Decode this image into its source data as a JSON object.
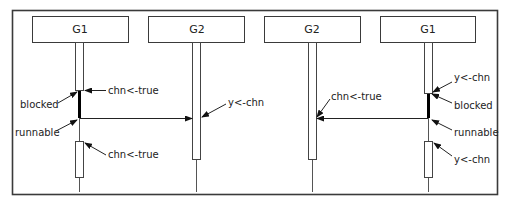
{
  "diagram": {
    "type": "sequence-diagram",
    "colors": {
      "stroke": "#3a3a3a",
      "blocked": "#000000",
      "text": "#222222",
      "background": "#ffffff"
    },
    "left_panel": {
      "participants": [
        {
          "id": "g1_left",
          "label": "G1"
        },
        {
          "id": "g2_left",
          "label": "G2"
        }
      ],
      "annotations": {
        "g1_first": "chn<-true",
        "g1_blocked": "blocked",
        "g1_runnable": "runnable",
        "g1_second": "chn<-true",
        "g2_receive": "y<-chn"
      },
      "message": {
        "from": "G1",
        "to": "G2",
        "direction": "right"
      }
    },
    "right_panel": {
      "participants": [
        {
          "id": "g2_right",
          "label": "G2"
        },
        {
          "id": "g1_right",
          "label": "G1"
        }
      ],
      "annotations": {
        "g2_send": "chn<-true",
        "g1_first": "y<-chn",
        "g1_blocked": "blocked",
        "g1_runnable": "runnable",
        "g1_second": "y<-chn"
      },
      "message": {
        "from": "G1",
        "to": "G2",
        "direction": "left"
      }
    }
  }
}
